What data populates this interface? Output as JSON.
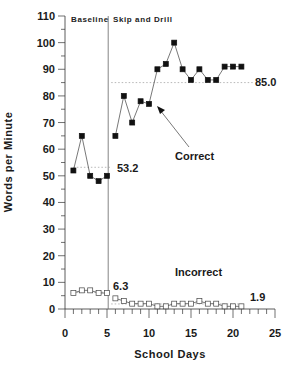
{
  "chart_data": {
    "type": "line",
    "title": "",
    "xlabel": "School Days",
    "ylabel": "Words per Minute",
    "xlim": [
      0,
      25
    ],
    "ylim": [
      0,
      110
    ],
    "xticks": [
      0,
      5,
      10,
      15,
      20,
      25
    ],
    "yticks": [
      0,
      10,
      20,
      30,
      40,
      50,
      60,
      70,
      80,
      90,
      100,
      110
    ],
    "grid": false,
    "phases": [
      {
        "label": "Baseline",
        "start": 0,
        "end": 5.5
      },
      {
        "label": "Skip and Drill",
        "start": 5.5,
        "end": 25
      }
    ],
    "phase_line_x": 5.5,
    "series": [
      {
        "name": "Correct",
        "marker": "filled-square",
        "segments": [
          {
            "x": [
              1,
              2,
              3,
              4,
              5
            ],
            "y": [
              52,
              65,
              50,
              48,
              50
            ]
          },
          {
            "x": [
              6,
              7,
              8,
              9,
              10,
              11,
              12,
              13,
              14,
              15,
              16,
              17,
              18,
              19,
              20,
              21
            ],
            "y": [
              65,
              80,
              70,
              78,
              77,
              90,
              92,
              100,
              90,
              86,
              90,
              86,
              86,
              91,
              91,
              91
            ]
          }
        ]
      },
      {
        "name": "Incorrect",
        "marker": "open-square",
        "segments": [
          {
            "x": [
              1,
              2,
              3,
              4,
              5
            ],
            "y": [
              6,
              7,
              7,
              6,
              6
            ]
          },
          {
            "x": [
              6,
              7,
              8,
              9,
              10,
              11,
              12,
              13,
              14,
              15,
              16,
              17,
              18,
              19,
              20,
              21
            ],
            "y": [
              4,
              3,
              2,
              2,
              2,
              1,
              1,
              2,
              2,
              2,
              3,
              2,
              2,
              1,
              1,
              1
            ]
          }
        ]
      }
    ],
    "mean_lines": [
      {
        "label": "53.2",
        "value": 53.2,
        "x_start": 1,
        "x_end": 5.5,
        "series": "Correct",
        "phase": "Baseline"
      },
      {
        "label": "85.0",
        "value": 85.0,
        "x_start": 5.5,
        "x_end": 22.5,
        "series": "Correct",
        "phase": "Skip and Drill"
      },
      {
        "label": "6.3",
        "value": 6.3,
        "x_start": 1,
        "x_end": 5.5,
        "series": "Incorrect",
        "phase": "Baseline"
      },
      {
        "label": "1.9",
        "value": 1.9,
        "x_start": 5.5,
        "x_end": 21,
        "series": "Incorrect",
        "phase": "Skip and Drill"
      }
    ],
    "annotations": [
      {
        "text": "Correct",
        "type": "label-with-arrow"
      },
      {
        "text": "Incorrect",
        "type": "label"
      }
    ]
  },
  "labels": {
    "ylabel": "Words per Minute",
    "xlabel": "School Days",
    "phase_baseline": "Baseline",
    "phase_skip": "Skip and Drill",
    "correct": "Correct",
    "incorrect": "Incorrect",
    "mean_baseline_correct": "53.2",
    "mean_skip_correct": "85.0",
    "mean_baseline_incorrect": "6.3",
    "mean_skip_incorrect": "1.9"
  },
  "colors": {
    "line": "#555555",
    "marker_fill": "#111111",
    "mean_line": "#999999",
    "axis": "#333333"
  }
}
